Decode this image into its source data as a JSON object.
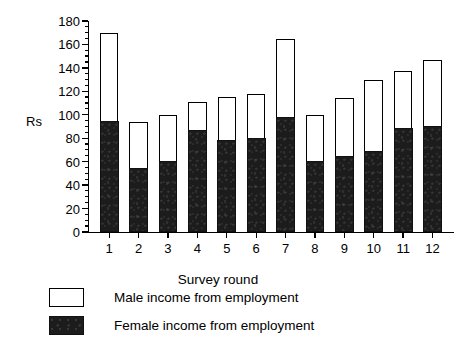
{
  "chart_data": {
    "type": "bar",
    "subtype": "stacked",
    "title": "",
    "xlabel": "Survey round",
    "ylabel": "Rs",
    "categories": [
      "1",
      "2",
      "3",
      "4",
      "5",
      "6",
      "7",
      "8",
      "9",
      "10",
      "11",
      "12"
    ],
    "ylim": [
      0,
      180
    ],
    "ytick_labels": [
      "0",
      "20",
      "40",
      "60",
      "80",
      "100",
      "120",
      "140",
      "160",
      "180"
    ],
    "ytick_values": [
      0,
      20,
      40,
      60,
      80,
      100,
      120,
      140,
      160,
      180
    ],
    "minor_tick_interval": 5,
    "grid": false,
    "legend_position": "below-plot-left",
    "series": [
      {
        "name": "Female income from employment",
        "color": "#1c1c1c",
        "fill": "solid-black",
        "values": [
          95,
          55,
          61,
          87,
          79,
          80,
          98,
          61,
          65,
          69,
          89,
          91
        ]
      },
      {
        "name": "Male income from employment",
        "color": "#ffffff",
        "fill": "white-outlined",
        "values": [
          75,
          39,
          39,
          24,
          36,
          38,
          67,
          39,
          49,
          61,
          48,
          56
        ]
      }
    ],
    "totals": [
      170,
      94,
      100,
      111,
      115,
      118,
      165,
      100,
      114,
      130,
      137,
      147
    ]
  },
  "legend": {
    "items": [
      {
        "label": "Male income from employment",
        "swatch": "white-square"
      },
      {
        "label": "Female income from employment",
        "swatch": "black-square"
      }
    ]
  }
}
